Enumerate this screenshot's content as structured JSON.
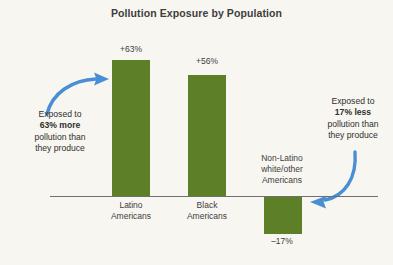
{
  "chart_data": {
    "type": "bar",
    "title": "Pollution Exposure by Population",
    "xlabel": "",
    "ylabel": "",
    "categories": [
      "Latino Americans",
      "Black Americans",
      "Non-Latino white/other Americans"
    ],
    "values": [
      63,
      56,
      -17
    ],
    "value_labels": [
      "+63%",
      "+56%",
      "–17%"
    ],
    "category_lines": [
      [
        "Latino",
        "Americans"
      ],
      [
        "Black",
        "Americans"
      ],
      [
        "Non-Latino",
        "white/other",
        "Americans"
      ]
    ],
    "ylim": [
      -25,
      75
    ],
    "grid": false,
    "legend": "none",
    "baseline": 0,
    "bar_color": "#5c7f28",
    "annotations": [
      {
        "id": "left",
        "lines": [
          "Exposed to",
          "63% more",
          "pollution than",
          "they produce"
        ],
        "bold_line_index": 1,
        "arrow": "curved-arrow-right",
        "arrow_color": "#4a8fd4",
        "target": "Latino Americans"
      },
      {
        "id": "right",
        "lines": [
          "Exposed to",
          "17% less",
          "pollution than",
          "they produce"
        ],
        "bold_line_index": 1,
        "arrow": "curved-arrow-down-left",
        "arrow_color": "#4a8fd4",
        "target": "Non-Latino white/other Americans"
      }
    ]
  },
  "colors": {
    "background": "#f8f6f1",
    "bar": "#5c7f28",
    "arrow": "#4a8fd4",
    "axis": "#6e6e6e",
    "text": "#3d3d3d"
  }
}
